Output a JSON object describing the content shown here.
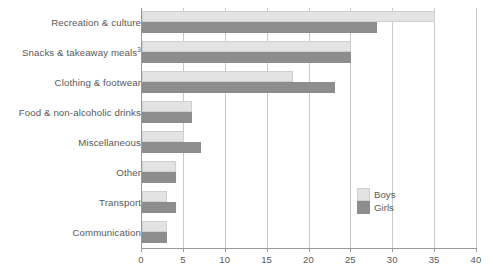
{
  "chart_data": {
    "type": "bar",
    "orientation": "horizontal",
    "title": "",
    "subtitle": "",
    "xlabel": "",
    "ylabel": "",
    "xlim": [
      0,
      40
    ],
    "xticks": [
      0,
      5,
      10,
      15,
      20,
      25,
      30,
      35,
      40
    ],
    "xtick_labels": [
      "0",
      "5",
      "10",
      "15",
      "20",
      "25",
      "30",
      "35",
      "40"
    ],
    "grid": true,
    "grid_axis": "x",
    "legend_position": "center-right",
    "categories": [
      "Recreation & culture",
      "Snacks & takeaway meals",
      "Clothing & footwear",
      "Food & non-alcoholic drinks",
      "Miscellaneous",
      "Other",
      "Transport",
      "Communication"
    ],
    "category_footnotes": [
      "",
      "3",
      "",
      "",
      "",
      "",
      "",
      ""
    ],
    "series": [
      {
        "name": "Boys",
        "color": "#e3e3e3",
        "values": [
          35,
          25,
          18,
          6,
          5,
          4,
          3,
          3
        ]
      },
      {
        "name": "Girls",
        "color": "#8d8d8d",
        "values": [
          28,
          25,
          23,
          6,
          7,
          4,
          4,
          3
        ]
      }
    ]
  },
  "legend": {
    "items": [
      {
        "label": "Boys",
        "swatch": "boys-swatch"
      },
      {
        "label": "Girls",
        "swatch": "girls-swatch"
      }
    ]
  },
  "axis": {
    "x_tick_labels": [
      "0",
      "5",
      "10",
      "15",
      "20",
      "25",
      "30",
      "35",
      "40"
    ]
  },
  "categories": [
    {
      "label": "Recreation & culture",
      "footnote": ""
    },
    {
      "label": "Snacks & takeaway meals",
      "footnote": "3"
    },
    {
      "label": "Clothing & footwear",
      "footnote": ""
    },
    {
      "label": "Food & non-alcoholic drinks",
      "footnote": ""
    },
    {
      "label": "Miscellaneous",
      "footnote": ""
    },
    {
      "label": "Other",
      "footnote": ""
    },
    {
      "label": "Transport",
      "footnote": ""
    },
    {
      "label": "Communication",
      "footnote": ""
    }
  ]
}
